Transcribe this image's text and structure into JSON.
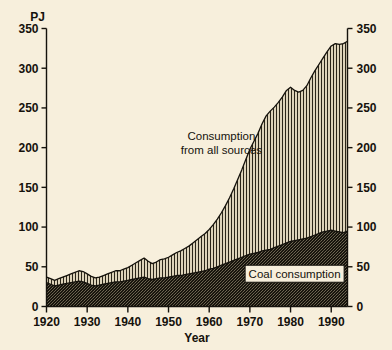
{
  "chart_data": {
    "type": "area",
    "title": "",
    "xlabel": "Year",
    "ylabel": "PJ",
    "ylabel_right": "",
    "xlim": [
      1920,
      1994
    ],
    "ylim": [
      0,
      350
    ],
    "grid": false,
    "stacked": true,
    "legend_position": "inline-annotation",
    "y_ticks": [
      0,
      50,
      100,
      150,
      200,
      250,
      300,
      350
    ],
    "y_ticks_right": [
      0,
      50,
      100,
      150,
      200,
      250,
      300,
      350
    ],
    "x_ticks": [
      1920,
      1930,
      1940,
      1950,
      1960,
      1970,
      1980,
      1990
    ],
    "annotations": [
      {
        "name": "total-series-label",
        "text_line1": "Consumption",
        "text_line2": "from all sources",
        "x": 1963,
        "y": 210,
        "boxed": false
      },
      {
        "name": "coal-series-label",
        "text": "Coal consumption",
        "x": 1981,
        "y": 40,
        "boxed": true
      }
    ],
    "x": [
      1920,
      1921,
      1922,
      1923,
      1924,
      1925,
      1926,
      1927,
      1928,
      1929,
      1930,
      1931,
      1932,
      1933,
      1934,
      1935,
      1936,
      1937,
      1938,
      1939,
      1940,
      1941,
      1942,
      1943,
      1944,
      1945,
      1946,
      1947,
      1948,
      1949,
      1950,
      1951,
      1952,
      1953,
      1954,
      1955,
      1956,
      1957,
      1958,
      1959,
      1960,
      1961,
      1962,
      1963,
      1964,
      1965,
      1966,
      1967,
      1968,
      1969,
      1970,
      1971,
      1972,
      1973,
      1974,
      1975,
      1976,
      1977,
      1978,
      1979,
      1980,
      1981,
      1982,
      1983,
      1984,
      1985,
      1986,
      1987,
      1988,
      1989,
      1990,
      1991,
      1992,
      1993,
      1994
    ],
    "series": [
      {
        "name": "Coal consumption",
        "fill": "dark-stipple",
        "color": "#1a1710",
        "values": [
          30,
          28,
          26,
          27,
          28,
          29,
          30,
          31,
          32,
          31,
          29,
          27,
          26,
          27,
          28,
          29,
          30,
          31,
          31,
          32,
          33,
          34,
          35,
          36,
          37,
          35,
          34,
          35,
          36,
          36,
          37,
          38,
          39,
          39,
          40,
          41,
          42,
          43,
          44,
          45,
          47,
          48,
          50,
          52,
          54,
          56,
          58,
          60,
          62,
          64,
          66,
          67,
          68,
          70,
          71,
          72,
          74,
          76,
          78,
          80,
          82,
          83,
          84,
          85,
          86,
          88,
          90,
          92,
          94,
          95,
          96,
          95,
          94,
          93,
          95
        ]
      },
      {
        "name": "Consumption from all sources",
        "fill": "light-vertical-hatch",
        "color": "#cfc5ab",
        "values": [
          37,
          35,
          33,
          35,
          37,
          39,
          41,
          43,
          45,
          44,
          41,
          38,
          36,
          37,
          39,
          41,
          43,
          45,
          45,
          47,
          49,
          52,
          55,
          58,
          61,
          57,
          54,
          56,
          59,
          60,
          62,
          65,
          68,
          70,
          73,
          76,
          80,
          84,
          88,
          92,
          97,
          103,
          110,
          118,
          127,
          137,
          148,
          160,
          172,
          185,
          198,
          208,
          218,
          230,
          240,
          246,
          251,
          257,
          264,
          272,
          276,
          272,
          270,
          272,
          278,
          288,
          297,
          305,
          313,
          321,
          328,
          331,
          330,
          331,
          334
        ]
      }
    ]
  },
  "axes": {
    "left_unit": "PJ",
    "x_axis_title": "Year"
  }
}
